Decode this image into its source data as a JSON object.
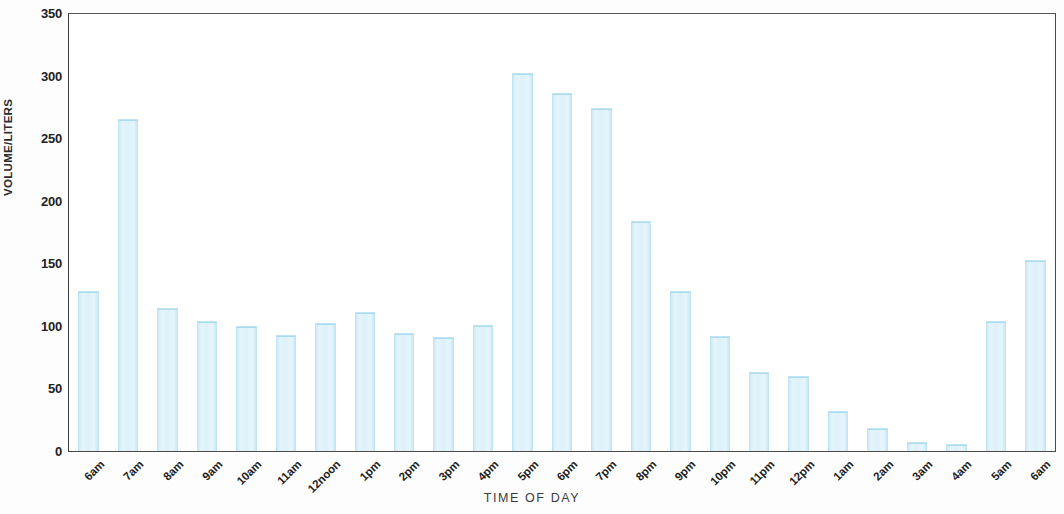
{
  "chart_data": {
    "type": "bar",
    "title": "",
    "xlabel": "TIME OF DAY",
    "ylabel": "VOLUME/LITERS",
    "ylim": [
      0,
      350
    ],
    "ytick_values": [
      0,
      50,
      100,
      150,
      200,
      250,
      300,
      350
    ],
    "ytick_labels": [
      "0",
      "50",
      "100",
      "150",
      "200",
      "250",
      "300",
      "350"
    ],
    "grid": false,
    "legend": null,
    "bar_color": "#ddf1fa",
    "bar_edge_color": "#bfe4f3",
    "axis_color": "#4a4a4a",
    "categories": [
      "6am",
      "7am",
      "8am",
      "9am",
      "10am",
      "11am",
      "12noon",
      "1pm",
      "2pm",
      "3pm",
      "4pm",
      "5pm",
      "6pm",
      "7pm",
      "8pm",
      "9pm",
      "10pm",
      "11pm",
      "12pm",
      "1am",
      "2am",
      "3am",
      "4am",
      "5am",
      "6am"
    ],
    "values": [
      128,
      265,
      114,
      104,
      100,
      93,
      102,
      111,
      94,
      91,
      101,
      302,
      286,
      274,
      184,
      128,
      92,
      63,
      60,
      32,
      18,
      7,
      6,
      104,
      153
    ]
  }
}
